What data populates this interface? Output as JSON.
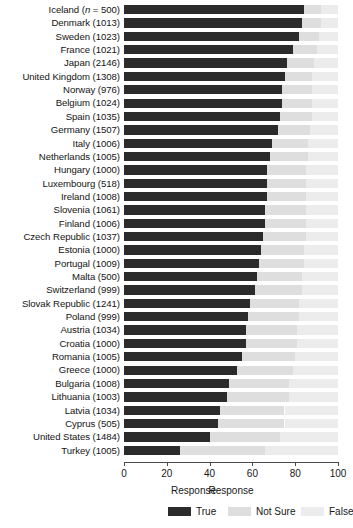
{
  "chart_data": {
    "type": "bar",
    "subtype": "stacked-horizontal-100pct",
    "title": "",
    "xlabel": "Response",
    "ylabel": "",
    "xlim": [
      0,
      100
    ],
    "xticks": [
      0,
      20,
      40,
      60,
      80,
      100
    ],
    "grid": false,
    "legend_title": "Response",
    "legend_position": "bottom",
    "orientation": "horizontal",
    "series": [
      {
        "name": "True",
        "color": "#2b2b2b"
      },
      {
        "name": "Not Sure",
        "color": "#dedede"
      },
      {
        "name": "False",
        "color": "#ececec"
      }
    ],
    "categories": [
      "Iceland (n = 500)",
      "Denmark (1013)",
      "Sweden (1023)",
      "France (1021)",
      "Japan (2146)",
      "United Kingdom (1308)",
      "Norway (976)",
      "Belgium (1024)",
      "Spain (1035)",
      "Germany (1507)",
      "Italy (1006)",
      "Netherlands (1005)",
      "Hungary (1000)",
      "Luxembourg (518)",
      "Ireland (1008)",
      "Slovenia (1061)",
      "Finland (1006)",
      "Czech Republic (1037)",
      "Estonia (1000)",
      "Portugal (1009)",
      "Malta (500)",
      "Switzerland (999)",
      "Slovak Republic (1241)",
      "Poland (999)",
      "Austria (1034)",
      "Croatia (1000)",
      "Romania (1005)",
      "Greece (1000)",
      "Bulgaria (1008)",
      "Lithuania (1003)",
      "Latvia (1034)",
      "Cyprus (505)",
      "United States (1484)",
      "Turkey (1005)"
    ],
    "rows": [
      {
        "label": "Iceland",
        "n": "500",
        "label_full": "Iceland (n = 500)",
        "italic_n": true,
        "True": 84,
        "Not Sure": 8,
        "False": 8
      },
      {
        "label": "Denmark",
        "n": "1013",
        "label_full": "Denmark (1013)",
        "italic_n": false,
        "True": 83,
        "Not Sure": 9,
        "False": 8
      },
      {
        "label": "Sweden",
        "n": "1023",
        "label_full": "Sweden (1023)",
        "italic_n": false,
        "True": 82,
        "Not Sure": 9,
        "False": 9
      },
      {
        "label": "France",
        "n": "1021",
        "label_full": "France (1021)",
        "italic_n": false,
        "True": 79,
        "Not Sure": 11,
        "False": 10
      },
      {
        "label": "Japan",
        "n": "2146",
        "label_full": "Japan (2146)",
        "italic_n": false,
        "True": 76,
        "Not Sure": 13,
        "False": 11
      },
      {
        "label": "United Kingdom",
        "n": "1308",
        "label_full": "United Kingdom (1308)",
        "italic_n": false,
        "True": 75,
        "Not Sure": 13,
        "False": 12
      },
      {
        "label": "Norway",
        "n": "976",
        "label_full": "Norway (976)",
        "italic_n": false,
        "True": 74,
        "Not Sure": 14,
        "False": 12
      },
      {
        "label": "Belgium",
        "n": "1024",
        "label_full": "Belgium (1024)",
        "italic_n": false,
        "True": 74,
        "Not Sure": 14,
        "False": 12
      },
      {
        "label": "Spain",
        "n": "1035",
        "label_full": "Spain (1035)",
        "italic_n": false,
        "True": 73,
        "Not Sure": 15,
        "False": 12
      },
      {
        "label": "Germany",
        "n": "1507",
        "label_full": "Germany (1507)",
        "italic_n": false,
        "True": 72,
        "Not Sure": 15,
        "False": 13
      },
      {
        "label": "Italy",
        "n": "1006",
        "label_full": "Italy (1006)",
        "italic_n": false,
        "True": 69,
        "Not Sure": 17,
        "False": 14
      },
      {
        "label": "Netherlands",
        "n": "1005",
        "label_full": "Netherlands (1005)",
        "italic_n": false,
        "True": 68,
        "Not Sure": 18,
        "False": 14
      },
      {
        "label": "Hungary",
        "n": "1000",
        "label_full": "Hungary (1000)",
        "italic_n": false,
        "True": 67,
        "Not Sure": 18,
        "False": 15
      },
      {
        "label": "Luxembourg",
        "n": "518",
        "label_full": "Luxembourg (518)",
        "italic_n": false,
        "True": 67,
        "Not Sure": 18,
        "False": 15
      },
      {
        "label": "Ireland",
        "n": "1008",
        "label_full": "Ireland (1008)",
        "italic_n": false,
        "True": 67,
        "Not Sure": 18,
        "False": 15
      },
      {
        "label": "Slovenia",
        "n": "1061",
        "label_full": "Slovenia (1061)",
        "italic_n": false,
        "True": 66,
        "Not Sure": 19,
        "False": 15
      },
      {
        "label": "Finland",
        "n": "1006",
        "label_full": "Finland (1006)",
        "italic_n": false,
        "True": 66,
        "Not Sure": 19,
        "False": 15
      },
      {
        "label": "Czech Republic",
        "n": "1037",
        "label_full": "Czech Republic (1037)",
        "italic_n": false,
        "True": 65,
        "Not Sure": 20,
        "False": 15
      },
      {
        "label": "Estonia",
        "n": "1000",
        "label_full": "Estonia (1000)",
        "italic_n": false,
        "True": 64,
        "Not Sure": 20,
        "False": 16
      },
      {
        "label": "Portugal",
        "n": "1009",
        "label_full": "Portugal (1009)",
        "italic_n": false,
        "True": 63,
        "Not Sure": 21,
        "False": 16
      },
      {
        "label": "Malta",
        "n": "500",
        "label_full": "Malta (500)",
        "italic_n": false,
        "True": 62,
        "Not Sure": 21,
        "False": 17
      },
      {
        "label": "Switzerland",
        "n": "999",
        "label_full": "Switzerland (999)",
        "italic_n": false,
        "True": 61,
        "Not Sure": 22,
        "False": 17
      },
      {
        "label": "Slovak Republic",
        "n": "1241",
        "label_full": "Slovak Republic (1241)",
        "italic_n": false,
        "True": 59,
        "Not Sure": 23,
        "False": 18
      },
      {
        "label": "Poland",
        "n": "999",
        "label_full": "Poland (999)",
        "italic_n": false,
        "True": 58,
        "Not Sure": 24,
        "False": 18
      },
      {
        "label": "Austria",
        "n": "1034",
        "label_full": "Austria (1034)",
        "italic_n": false,
        "True": 57,
        "Not Sure": 24,
        "False": 19
      },
      {
        "label": "Croatia",
        "n": "1000",
        "label_full": "Croatia (1000)",
        "italic_n": false,
        "True": 57,
        "Not Sure": 24,
        "False": 19
      },
      {
        "label": "Romania",
        "n": "1005",
        "label_full": "Romania (1005)",
        "italic_n": false,
        "True": 55,
        "Not Sure": 25,
        "False": 20
      },
      {
        "label": "Greece",
        "n": "1000",
        "label_full": "Greece (1000)",
        "italic_n": false,
        "True": 53,
        "Not Sure": 26,
        "False": 21
      },
      {
        "label": "Bulgaria",
        "n": "1008",
        "label_full": "Bulgaria (1008)",
        "italic_n": false,
        "True": 49,
        "Not Sure": 28,
        "False": 23
      },
      {
        "label": "Lithuania",
        "n": "1003",
        "label_full": "Lithuania (1003)",
        "italic_n": false,
        "True": 48,
        "Not Sure": 29,
        "False": 23
      },
      {
        "label": "Latvia",
        "n": "1034",
        "label_full": "Latvia (1034)",
        "italic_n": false,
        "True": 45,
        "Not Sure": 30,
        "False": 25
      },
      {
        "label": "Cyprus",
        "n": "505",
        "label_full": "Cyprus (505)",
        "italic_n": false,
        "True": 44,
        "Not Sure": 31,
        "False": 25
      },
      {
        "label": "United States",
        "n": "1484",
        "label_full": "United States (1484)",
        "italic_n": false,
        "True": 40,
        "Not Sure": 33,
        "False": 27
      },
      {
        "label": "Turkey",
        "n": "1005",
        "label_full": "Turkey (1005)",
        "italic_n": false,
        "True": 26,
        "Not Sure": 40,
        "False": 34
      }
    ]
  }
}
